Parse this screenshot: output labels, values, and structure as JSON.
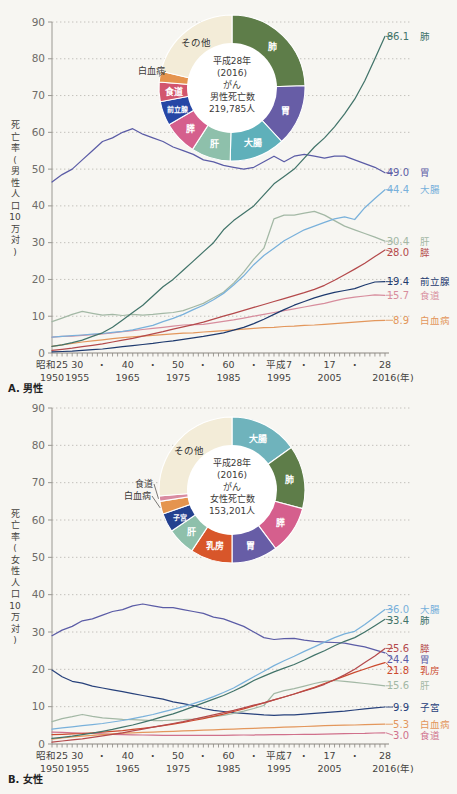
{
  "figure": {
    "background": "#f7f6f2"
  },
  "x_axis": {
    "era_labels": [
      {
        "year": 1950,
        "label": "昭和25"
      },
      {
        "year": 1955,
        "label": "30"
      },
      {
        "year": 1960,
        "label": "・"
      },
      {
        "year": 1965,
        "label": "40"
      },
      {
        "year": 1970,
        "label": "・"
      },
      {
        "year": 1975,
        "label": "50"
      },
      {
        "year": 1980,
        "label": "・"
      },
      {
        "year": 1985,
        "label": "60"
      },
      {
        "year": 1990,
        "label": "・"
      },
      {
        "year": 1995,
        "label": "平成7"
      },
      {
        "year": 2000,
        "label": "・"
      },
      {
        "year": 2005,
        "label": "17"
      },
      {
        "year": 2010,
        "label": "・"
      },
      {
        "year": 2016,
        "label": "28"
      }
    ],
    "year_labels": [
      {
        "year": 1950,
        "label": "1950"
      },
      {
        "year": 1955,
        "label": "1955"
      },
      {
        "year": 1965,
        "label": "1965"
      },
      {
        "year": 1975,
        "label": "1975"
      },
      {
        "year": 1985,
        "label": "1985"
      },
      {
        "year": 1995,
        "label": "1995"
      },
      {
        "year": 2005,
        "label": "2005"
      },
      {
        "year": 2016,
        "label": "2016(年)"
      }
    ],
    "xlim": [
      1950,
      2016
    ]
  },
  "chart_data": [
    {
      "id": "male",
      "type": "line",
      "panel_label": "A. 男性",
      "ylabel": "死亡率(男性人口10万対)",
      "ylim": [
        0,
        90
      ],
      "ytick_interval": 10,
      "grid": true,
      "legend_position": "right-edge-labels",
      "years": [
        1950,
        1952,
        1954,
        1956,
        1958,
        1960,
        1962,
        1964,
        1966,
        1968,
        1970,
        1972,
        1974,
        1976,
        1978,
        1980,
        1982,
        1984,
        1986,
        1988,
        1990,
        1992,
        1994,
        1996,
        1998,
        2000,
        2002,
        2004,
        2006,
        2008,
        2010,
        2012,
        2014,
        2016
      ],
      "series": [
        {
          "key": "stomach",
          "name": "胃",
          "color": "#5b5ca6",
          "end_label": "49.0",
          "values": [
            46.5,
            48.5,
            50,
            52.5,
            55,
            57.5,
            58.5,
            60,
            61,
            59.5,
            58.5,
            57.5,
            56,
            55,
            54,
            52.5,
            52,
            51,
            50.5,
            50,
            50.5,
            52,
            53.5,
            52,
            53.5,
            54,
            53.5,
            53,
            53.5,
            53.5,
            52.5,
            51.5,
            50.5,
            49.0
          ]
        },
        {
          "key": "liver",
          "name": "肝",
          "color": "#a3b8a5",
          "end_label": "30.4",
          "values": [
            8.5,
            9.5,
            10.5,
            11.3,
            10.8,
            10.3,
            10.5,
            10.2,
            10.5,
            10.3,
            10.5,
            10.8,
            11,
            11.5,
            12.5,
            13.5,
            15,
            16.5,
            19,
            22,
            25.5,
            28.5,
            36.5,
            37.5,
            37.5,
            38,
            38.5,
            37.5,
            36,
            34.5,
            33.5,
            32.5,
            31.5,
            30.4
          ]
        },
        {
          "key": "esophagus",
          "name": "食道",
          "color": "#d78d9d",
          "end_label": "15.7",
          "values": [
            4.3,
            4.5,
            4.6,
            4.8,
            5,
            5.2,
            5.5,
            5.8,
            6.1,
            6.4,
            6.7,
            7,
            7.3,
            7.6,
            7.7,
            7.8,
            8.2,
            8.6,
            9,
            9.5,
            10,
            10.5,
            11,
            11.5,
            12,
            12.5,
            13,
            13.5,
            14.2,
            14.8,
            15.2,
            15.5,
            15.8,
            15.7
          ]
        },
        {
          "key": "leukemia",
          "name": "白血病",
          "color": "#e3975c",
          "end_label": "8.9",
          "values": [
            1.8,
            2.2,
            2.6,
            3,
            3.3,
            3.6,
            3.9,
            4.2,
            4.4,
            4.6,
            4.8,
            5,
            5.2,
            5.4,
            5.5,
            5.7,
            5.9,
            6.1,
            6.3,
            6.5,
            6.7,
            6.9,
            7,
            7.2,
            7.3,
            7.5,
            7.6,
            7.8,
            8,
            8.2,
            8.4,
            8.6,
            8.8,
            8.9
          ]
        },
        {
          "key": "colon",
          "name": "大腸",
          "color": "#79b1db",
          "end_label": "44.4",
          "values": [
            4.3,
            4.5,
            4.7,
            4.9,
            5.1,
            5.3,
            5.6,
            5.9,
            6.3,
            6.9,
            7.5,
            8.5,
            9.4,
            10.5,
            11.8,
            13,
            14.5,
            16.2,
            18.5,
            21,
            24,
            26.5,
            28.5,
            30.5,
            32,
            33.5,
            34.5,
            35.5,
            36.5,
            37,
            36.3,
            39.5,
            42,
            44.4
          ]
        },
        {
          "key": "pancreas",
          "name": "膵",
          "color": "#b4494b",
          "end_label": "28.0",
          "values": [
            0.7,
            1,
            1.3,
            1.7,
            2.1,
            2.5,
            3,
            3.5,
            4,
            4.6,
            5.2,
            5.8,
            6.5,
            7.1,
            7.7,
            8.4,
            9.2,
            10,
            10.8,
            11.6,
            12.4,
            13.2,
            14,
            14.8,
            15.6,
            16.4,
            17.3,
            18.4,
            19.8,
            21.3,
            22.8,
            24.4,
            26.2,
            28.0
          ]
        },
        {
          "key": "prostate",
          "name": "前立腺",
          "color": "#1e3a6e",
          "end_label": "19.4",
          "values": [
            0.3,
            0.4,
            0.5,
            0.7,
            0.9,
            1.1,
            1.4,
            1.7,
            2,
            2.3,
            2.6,
            3,
            3.3,
            3.7,
            4.1,
            4.5,
            5,
            5.5,
            6.2,
            7,
            8,
            9.2,
            10.5,
            11.8,
            13,
            14,
            15,
            15.8,
            16.5,
            17,
            17.5,
            18.5,
            19.3,
            19.4
          ]
        },
        {
          "key": "lung",
          "name": "肺",
          "color": "#42746a",
          "end_label": "86.1",
          "values": [
            1.8,
            2.2,
            2.8,
            3.5,
            4.5,
            5.5,
            7,
            9,
            11,
            13,
            15.5,
            18,
            20,
            22.5,
            25,
            27.5,
            30,
            33.5,
            36,
            38,
            40,
            43,
            46,
            48,
            50,
            53,
            56,
            58.5,
            61.5,
            65,
            69,
            74,
            80,
            86.1
          ]
        }
      ],
      "donut": {
        "center_lines": [
          "平成28年",
          "(2016)",
          "がん",
          "男性死亡数",
          "219,785人"
        ],
        "slices": [
          {
            "key": "lung",
            "label": "肺",
            "pct": 24.5,
            "color": "#5e7d49",
            "text": "#ffffff"
          },
          {
            "key": "stomach",
            "label": "胃",
            "pct": 13.6,
            "color": "#675da6",
            "text": "#ffffff"
          },
          {
            "key": "colon",
            "label": "大腸",
            "pct": 12.3,
            "color": "#5fb0ba",
            "text": "#ffffff"
          },
          {
            "key": "liver",
            "label": "肝",
            "pct": 8.7,
            "color": "#8ec0ab",
            "text": "#ffffff"
          },
          {
            "key": "pancreas",
            "label": "膵",
            "pct": 7.5,
            "color": "#d55f8d",
            "text": "#ffffff"
          },
          {
            "key": "prostate",
            "label": "前立腺",
            "pct": 5.4,
            "color": "#2646a5",
            "text": "#ffffff",
            "small": true
          },
          {
            "key": "esophagus",
            "label": "食道",
            "pct": 4.3,
            "color": "#d2556e",
            "text": "#ffffff"
          },
          {
            "key": "leukemia",
            "label": "白血病",
            "pct": 2.4,
            "color": "#e5944e",
            "outside": true,
            "label_xy": [
              165,
              74
            ]
          },
          {
            "key": "other",
            "label": "その他",
            "pct": 21.3,
            "color": "#f3ecd8",
            "text": "#333333"
          }
        ]
      }
    },
    {
      "id": "female",
      "type": "line",
      "panel_label": "B. 女性",
      "ylabel": "死亡率(女性人口10万対)",
      "ylim": [
        0,
        90
      ],
      "ytick_interval": 10,
      "grid": true,
      "legend_position": "right-edge-labels",
      "years": [
        1950,
        1952,
        1954,
        1956,
        1958,
        1960,
        1962,
        1964,
        1966,
        1968,
        1970,
        1972,
        1974,
        1976,
        1978,
        1980,
        1982,
        1984,
        1986,
        1988,
        1990,
        1992,
        1994,
        1996,
        1998,
        2000,
        2002,
        2004,
        2006,
        2008,
        2010,
        2012,
        2014,
        2016
      ],
      "series": [
        {
          "key": "stomach",
          "name": "胃",
          "color": "#5b5ca6",
          "end_label": "24.4",
          "values": [
            29,
            30.5,
            31.5,
            33,
            33.5,
            34.5,
            35.5,
            36,
            37,
            37.5,
            37,
            36.5,
            36.5,
            36,
            35.5,
            35,
            34,
            33.5,
            32.5,
            31.5,
            30,
            28.5,
            28,
            28.2,
            28.3,
            27.8,
            27.5,
            27.3,
            27.2,
            27,
            26.5,
            26,
            25.2,
            24.4
          ]
        },
        {
          "key": "uterus",
          "name": "子宮",
          "color": "#27417b",
          "end_label": "9.9",
          "values": [
            19.8,
            18,
            16.8,
            16.3,
            15.5,
            15,
            14.5,
            14,
            13.5,
            13,
            12.5,
            12,
            11.3,
            10.8,
            10.3,
            9.5,
            9,
            8.7,
            8.4,
            8.2,
            8,
            7.8,
            7.7,
            7.8,
            7.8,
            8,
            8.2,
            8.4,
            8.6,
            8.8,
            9.1,
            9.4,
            9.7,
            9.9
          ]
        },
        {
          "key": "liver",
          "name": "肝",
          "color": "#a3b8a5",
          "end_label": "15.6",
          "values": [
            6,
            6.8,
            7.3,
            7.9,
            7.4,
            7,
            6.8,
            6.6,
            6.5,
            6.4,
            6.3,
            6.3,
            6.4,
            6.5,
            6.7,
            7,
            7.3,
            7.7,
            8.2,
            8.8,
            9.5,
            10.3,
            13.5,
            14.3,
            14.8,
            15.5,
            16.2,
            16.8,
            17,
            16.8,
            16.5,
            16.2,
            15.9,
            15.6
          ]
        },
        {
          "key": "esophagus",
          "name": "食道",
          "color": "#d0708b",
          "end_label": "3.0",
          "values": [
            3.2,
            3.1,
            3,
            2.9,
            2.8,
            2.7,
            2.6,
            2.5,
            2.45,
            2.4,
            2.35,
            2.3,
            2.3,
            2.3,
            2.3,
            2.3,
            2.3,
            2.3,
            2.35,
            2.4,
            2.4,
            2.45,
            2.5,
            2.5,
            2.55,
            2.6,
            2.6,
            2.65,
            2.7,
            2.75,
            2.8,
            2.85,
            2.95,
            3.0
          ]
        },
        {
          "key": "leukemia",
          "name": "白血病",
          "color": "#e3975c",
          "end_label": "5.3",
          "values": [
            1.3,
            1.6,
            1.9,
            2.1,
            2.3,
            2.5,
            2.7,
            2.9,
            3,
            3.1,
            3.2,
            3.3,
            3.4,
            3.5,
            3.6,
            3.7,
            3.8,
            3.9,
            4,
            4.1,
            4.2,
            4.3,
            4.4,
            4.5,
            4.6,
            4.7,
            4.8,
            4.9,
            5,
            5.05,
            5.1,
            5.2,
            5.25,
            5.3
          ]
        },
        {
          "key": "breast",
          "name": "乳房",
          "color": "#cc4a2e",
          "end_label": "21.8",
          "values": [
            2.5,
            2.6,
            2.7,
            2.8,
            3,
            3.2,
            3.4,
            3.6,
            3.9,
            4.2,
            4.5,
            4.9,
            5.3,
            5.8,
            6.3,
            6.8,
            7.4,
            8,
            8.7,
            9.4,
            10.2,
            11,
            11.8,
            12.6,
            13.4,
            14.3,
            15.2,
            16.2,
            17.2,
            18.2,
            19.2,
            20.1,
            21,
            21.8
          ]
        },
        {
          "key": "pancreas",
          "name": "膵",
          "color": "#b4494b",
          "end_label": "25.6",
          "values": [
            0.5,
            0.8,
            1.1,
            1.4,
            1.8,
            2.2,
            2.6,
            3,
            3.5,
            4,
            4.5,
            5,
            5.5,
            6,
            6.6,
            7.2,
            7.8,
            8.4,
            9,
            9.7,
            10.4,
            11,
            11.8,
            12.6,
            13.4,
            14.2,
            15,
            16,
            17.2,
            18.5,
            20,
            21.8,
            23.6,
            25.6
          ]
        },
        {
          "key": "colon",
          "name": "大腸",
          "color": "#79b1db",
          "end_label": "36.0",
          "values": [
            4,
            4.3,
            4.6,
            4.9,
            5.2,
            5.5,
            5.9,
            6.3,
            6.8,
            7.3,
            7.9,
            8.6,
            9.3,
            10,
            10.8,
            11.7,
            12.7,
            13.8,
            15,
            16.5,
            18,
            19.5,
            21,
            22.3,
            23.5,
            24.8,
            26,
            27.3,
            28.5,
            29.5,
            30.2,
            32,
            34,
            36.0
          ]
        },
        {
          "key": "lung",
          "name": "肺",
          "color": "#42746a",
          "end_label": "33.4",
          "values": [
            1.5,
            1.8,
            2.1,
            2.5,
            2.9,
            3.4,
            3.9,
            4.5,
            5.1,
            5.8,
            6.5,
            7.3,
            8.1,
            9,
            10,
            11,
            12,
            13,
            14.2,
            15.5,
            17,
            18.2,
            19.3,
            20.3,
            21.3,
            22.5,
            23.8,
            25,
            26.3,
            27.5,
            28.5,
            30,
            31.7,
            33.4
          ]
        }
      ],
      "donut": {
        "center_lines": [
          "平成28年",
          "(2016)",
          "がん",
          "女性死亡数",
          "153,201人"
        ],
        "slices": [
          {
            "key": "colon",
            "label": "大腸",
            "pct": 15.1,
            "color": "#6fb3bc",
            "text": "#ffffff"
          },
          {
            "key": "lung",
            "label": "肺",
            "pct": 14.0,
            "color": "#5e7d49",
            "text": "#ffffff"
          },
          {
            "key": "pancreas",
            "label": "膵",
            "pct": 10.7,
            "color": "#d55f8d",
            "text": "#ffffff"
          },
          {
            "key": "stomach",
            "label": "胃",
            "pct": 10.2,
            "color": "#675da6",
            "text": "#ffffff"
          },
          {
            "key": "breast",
            "label": "乳房",
            "pct": 9.3,
            "color": "#d8562a",
            "text": "#ffffff"
          },
          {
            "key": "liver",
            "label": "肝",
            "pct": 6.2,
            "color": "#8ec0ab",
            "text": "#ffffff"
          },
          {
            "key": "uterus",
            "label": "子宮",
            "pct": 4.2,
            "color": "#24418f",
            "text": "#ffffff",
            "small": true
          },
          {
            "key": "leukemia",
            "label": "白血病",
            "pct": 2.8,
            "color": "#e5944e",
            "outside": true,
            "label_xy": [
              151,
              101
            ]
          },
          {
            "key": "esophagus",
            "label": "食道",
            "pct": 1.2,
            "color": "#d98ba0",
            "outside": true,
            "label_xy": [
              153,
              89
            ]
          },
          {
            "key": "other",
            "label": "その他",
            "pct": 26.3,
            "color": "#f3ecd8",
            "text": "#333333"
          }
        ]
      }
    }
  ]
}
